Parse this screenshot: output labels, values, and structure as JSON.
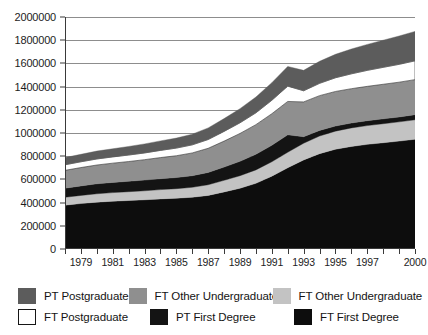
{
  "chart_data": {
    "type": "area",
    "title": "",
    "xlabel": "",
    "ylabel": "",
    "stacked": true,
    "grid": true,
    "legend_position": "bottom",
    "ylim": [
      0,
      2000000
    ],
    "ytick_step": 200000,
    "ytick_labels": [
      "0",
      "200000",
      "400000",
      "600000",
      "800000",
      "1000000",
      "1200000",
      "1400000",
      "1600000",
      "1800000",
      "2000000"
    ],
    "ytick_values": [
      0,
      200000,
      400000,
      600000,
      800000,
      1000000,
      1200000,
      1400000,
      1600000,
      1800000,
      2000000
    ],
    "x": [
      1978,
      1979,
      1980,
      1981,
      1982,
      1983,
      1984,
      1985,
      1986,
      1987,
      1988,
      1989,
      1990,
      1991,
      1992,
      1993,
      1994,
      1995,
      1996,
      1997,
      1998,
      1999,
      2000
    ],
    "xtick_labels": [
      "1979",
      "1981",
      "1983",
      "1985",
      "1987",
      "1989",
      "1991",
      "1993",
      "1995",
      "1997",
      "2000"
    ],
    "xtick_years": [
      1979,
      1981,
      1983,
      1985,
      1987,
      1989,
      1991,
      1993,
      1995,
      1997,
      2000
    ],
    "series": [
      {
        "name": "FT First Degree",
        "color": "#0d0d0d",
        "values": [
          378000,
          392000,
          404000,
          412000,
          418000,
          424000,
          432000,
          438000,
          446000,
          462000,
          492000,
          524000,
          566000,
          628000,
          700000,
          768000,
          822000,
          860000,
          884000,
          902000,
          916000,
          930000,
          946000
        ]
      },
      {
        "name": "PT First Degree",
        "color": "#c3c3c3",
        "values": [
          68000,
          70000,
          72000,
          74000,
          76000,
          78000,
          80000,
          82000,
          86000,
          92000,
          100000,
          108000,
          116000,
          124000,
          134000,
          144000,
          152000,
          156000,
          160000,
          162000,
          164000,
          166000,
          168000
        ]
      },
      {
        "name": "FT Other Undergraduate",
        "color": "#141414",
        "values": [
          78000,
          82000,
          86000,
          88000,
          90000,
          92000,
          94000,
          96000,
          100000,
          106000,
          114000,
          124000,
          134000,
          142000,
          150000,
          56000,
          48000,
          44000,
          42000,
          42000,
          42000,
          42000,
          44000
        ]
      },
      {
        "name": "FT Other Undergraduate ",
        "color": "#8f8f8f",
        "values": [
          154000,
          158000,
          162000,
          166000,
          170000,
          176000,
          182000,
          188000,
          196000,
          208000,
          224000,
          240000,
          256000,
          272000,
          288000,
          300000,
          300000,
          298000,
          296000,
          296000,
          298000,
          300000,
          302000
        ]
      },
      {
        "name": "FT Postgraduate",
        "color": "#ffffff",
        "values": [
          48000,
          50000,
          52000,
          54000,
          56000,
          58000,
          62000,
          66000,
          70000,
          76000,
          84000,
          92000,
          102000,
          116000,
          132000,
          96000,
          106000,
          118000,
          128000,
          138000,
          146000,
          154000,
          162000
        ]
      },
      {
        "name": "PT Postgraduate",
        "color": "#5c5c5c",
        "values": [
          62000,
          64000,
          68000,
          70000,
          74000,
          78000,
          82000,
          86000,
          92000,
          100000,
          110000,
          122000,
          136000,
          152000,
          170000,
          176000,
          190000,
          202000,
          214000,
          224000,
          234000,
          244000,
          254000
        ]
      }
    ],
    "legend": [
      {
        "label": "PT Postgraduate",
        "color": "#5c5c5c",
        "border": "#5c5c5c"
      },
      {
        "label": "FT Other Undergraduate",
        "color": "#8f8f8f",
        "border": "#8f8f8f"
      },
      {
        "label": "FT Other Undergraduate",
        "color": "#c3c3c3",
        "border": "#c3c3c3"
      },
      {
        "label": "FT Postgraduate",
        "color": "#ffffff",
        "border": "#161616"
      },
      {
        "label": "PT First Degree",
        "color": "#141414",
        "border": "#141414"
      },
      {
        "label": "FT First Degree",
        "color": "#0d0d0d",
        "border": "#0d0d0d"
      }
    ]
  }
}
